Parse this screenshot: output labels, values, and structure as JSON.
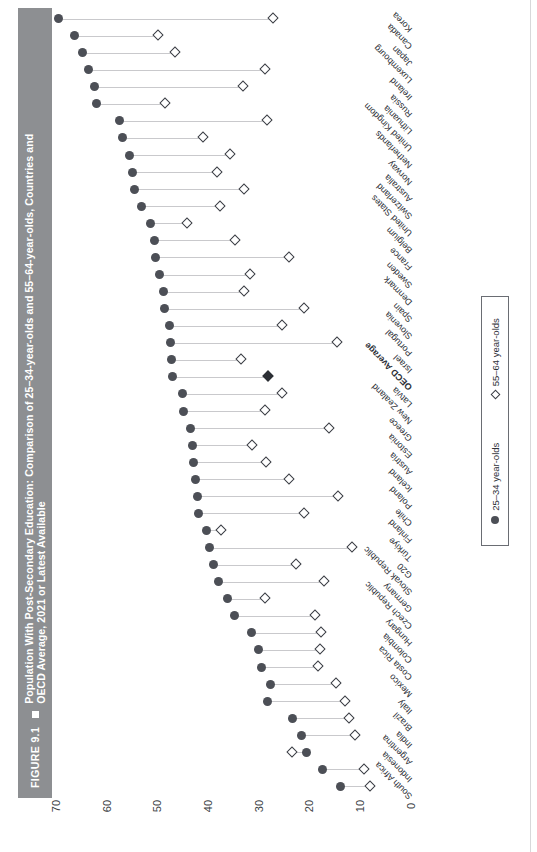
{
  "figure": {
    "number": "FIGURE 9.1",
    "marker_icon": "square-bullet-icon",
    "title": "Population With Post-Secondary Education: Comparison of 25–34-year-olds and 55–64-year-olds, Countries and OECD Average, 2021 or Latest Available"
  },
  "legend": {
    "position": "right",
    "items": [
      {
        "icon": "filled-circle-icon",
        "label": "25–34 year-olds",
        "color": "#4c4f56"
      },
      {
        "icon": "open-diamond-icon",
        "label": "55–64 year-olds",
        "color": "#3a3d44"
      }
    ]
  },
  "chart_data": {
    "type": "scatter",
    "subtype": "dumbbell",
    "title": "Population With Post-Secondary Education: Comparison of 25–34-year-olds and 55–64-year-olds, Countries and OECD Average, 2021 or Latest Available",
    "xlabel": "",
    "ylabel": "",
    "orientation": "rotated-90-clockwise",
    "xlim": [
      0,
      70
    ],
    "xticks": [
      70,
      60,
      50,
      40,
      30,
      20,
      10,
      0
    ],
    "xtick_direction": "descending-left-to-right",
    "grid": false,
    "legend_position": "right",
    "categories": [
      "Korea",
      "Canada",
      "Japan",
      "Luxembourg",
      "Ireland",
      "Russia",
      "Lithuania",
      "United Kingdom",
      "Netherlands",
      "Norway",
      "Australia",
      "Switzerland",
      "United States",
      "Belgium",
      "France",
      "Sweden",
      "Denmark",
      "Spain",
      "Slovenia",
      "Portugal",
      "Israel",
      "OECD Average",
      "Latvia",
      "New Zealand",
      "Greece",
      "Estonia",
      "Austria",
      "Iceland",
      "Poland",
      "Chile",
      "Finland",
      "Türkiye",
      "G20",
      "Slovak Republic",
      "Germany",
      "Czech Republic",
      "Hungary",
      "Colombia",
      "Costa Rica",
      "Mexico",
      "Italy",
      "Brazil",
      "India",
      "Argentina",
      "Indonesia",
      "South Africa"
    ],
    "highlight_category": "OECD Average",
    "series": [
      {
        "name": "25–34 year-olds",
        "marker": "filled-circle",
        "color": "#4c4f56",
        "values": [
          69.5,
          66.4,
          64.8,
          63.6,
          62.5,
          62.1,
          57.5,
          56.8,
          55.6,
          55.0,
          54.6,
          53.2,
          51.3,
          50.6,
          50.4,
          49.5,
          48.9,
          48.7,
          47.6,
          47.5,
          47.2,
          47.1,
          45.1,
          44.9,
          43.5,
          43.1,
          42.8,
          42.5,
          42.1,
          41.9,
          40.3,
          39.8,
          38.9,
          37.9,
          36.2,
          34.9,
          31.4,
          30.1,
          29.5,
          27.8,
          28.2,
          23.4,
          21.6,
          20.6,
          17.5,
          13.9
        ]
      },
      {
        "name": "55–64 year-olds",
        "marker": "open-diamond",
        "color": "#3a3d44",
        "values": [
          27.0,
          49.8,
          46.4,
          28.7,
          33.1,
          48.3,
          28.3,
          40.9,
          35.5,
          38.1,
          32.9,
          37.5,
          44.0,
          34.6,
          24.0,
          31.6,
          32.8,
          21.0,
          25.4,
          14.4,
          33.5,
          28.1,
          25.3,
          28.6,
          16.1,
          31.2,
          28.4,
          23.9,
          14.2,
          20.9,
          37.3,
          11.6,
          22.6,
          17.0,
          28.6,
          18.9,
          17.7,
          17.8,
          18.2,
          14.7,
          12.9,
          12.2,
          11.0,
          23.3,
          9.2,
          8.0
        ]
      }
    ],
    "notes": [
      "OECD Average row is drawn with a filled diamond and bold category label.",
      "For Argentina the 55–64 marker lies to the left of the 25–34 marker (higher value).",
      "South Africa has only the 25–34 marker visible near the right end."
    ]
  }
}
